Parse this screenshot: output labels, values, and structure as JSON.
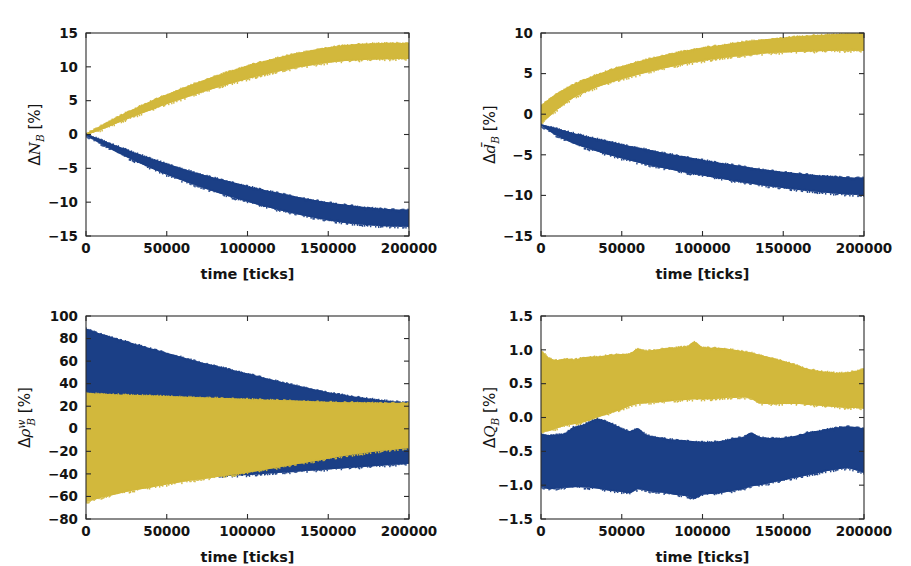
{
  "figure": {
    "width": 911,
    "height": 566,
    "background": "#ffffff",
    "colors": {
      "yellow": "#d2b83c",
      "blue": "#1b3f86",
      "axis": "#2a2a2a",
      "text": "#141414"
    },
    "series_names": [
      "yellow-band",
      "blue-band"
    ]
  },
  "chart_data": [
    {
      "id": "panel-top-left",
      "type": "area",
      "title": "",
      "xlabel": "time [ticks]",
      "ylabel": "ΔN_B [%]",
      "ylabel_parts": {
        "delta": "Δ",
        "symbol": "N",
        "sub": "B",
        "unit": " [%]",
        "overbar": false,
        "sup": ""
      },
      "xlim": [
        0,
        200000
      ],
      "ylim": [
        -15,
        15
      ],
      "xticks": [
        0,
        50000,
        100000,
        150000,
        200000
      ],
      "xticklabels": [
        "0",
        "50000",
        "100000",
        "150000",
        "200000"
      ],
      "yticks": [
        15,
        10,
        5,
        0,
        -5,
        -10,
        -15
      ],
      "yticklabels": [
        "15",
        "10",
        "5",
        "0",
        "−5",
        "−10",
        "−15"
      ],
      "grid": false,
      "legend": "none",
      "x": [
        0,
        10000,
        20000,
        30000,
        40000,
        50000,
        60000,
        70000,
        80000,
        90000,
        100000,
        110000,
        120000,
        130000,
        140000,
        150000,
        160000,
        170000,
        180000,
        190000,
        200000
      ],
      "series": [
        {
          "name": "yellow-band",
          "color": "#d2b83c",
          "upper": [
            0.15,
            1.45,
            2.7,
            3.85,
            4.95,
            5.95,
            6.9,
            7.8,
            8.65,
            9.45,
            10.2,
            10.85,
            11.45,
            12.0,
            12.5,
            12.9,
            13.2,
            13.4,
            13.5,
            13.55,
            13.5
          ],
          "lower": [
            -0.1,
            0.75,
            1.75,
            2.7,
            3.6,
            4.5,
            5.3,
            6.1,
            6.85,
            7.55,
            8.2,
            8.8,
            9.35,
            9.85,
            10.25,
            10.6,
            10.85,
            11.0,
            11.1,
            11.15,
            11.15
          ]
        },
        {
          "name": "blue-band",
          "color": "#1b3f86",
          "upper": [
            0.1,
            -0.8,
            -1.75,
            -2.65,
            -3.5,
            -4.3,
            -5.05,
            -5.75,
            -6.4,
            -7.0,
            -7.6,
            -8.15,
            -8.65,
            -9.15,
            -9.6,
            -10.0,
            -10.35,
            -10.65,
            -10.9,
            -11.05,
            -11.1
          ],
          "lower": [
            -0.15,
            -1.5,
            -2.75,
            -3.9,
            -4.95,
            -5.95,
            -6.85,
            -7.7,
            -8.5,
            -9.25,
            -9.95,
            -10.6,
            -11.2,
            -11.75,
            -12.25,
            -12.7,
            -13.05,
            -13.3,
            -13.5,
            -13.6,
            -13.65
          ]
        }
      ]
    },
    {
      "id": "panel-top-right",
      "type": "area",
      "title": "",
      "xlabel": "time [ticks]",
      "ylabel": "Δd̄_B [%]",
      "ylabel_parts": {
        "delta": "Δ",
        "symbol": "d",
        "sub": "B",
        "unit": " [%]",
        "overbar": true,
        "sup": ""
      },
      "xlim": [
        0,
        200000
      ],
      "ylim": [
        -15,
        10
      ],
      "xticks": [
        0,
        50000,
        100000,
        150000,
        200000
      ],
      "xticklabels": [
        "0",
        "50000",
        "100000",
        "150000",
        "200000"
      ],
      "yticks": [
        10,
        5,
        0,
        -5,
        -10,
        -15
      ],
      "yticklabels": [
        "10",
        "5",
        "0",
        "−5",
        "−10",
        "−15"
      ],
      "grid": false,
      "legend": "none",
      "x": [
        0,
        10000,
        20000,
        30000,
        40000,
        50000,
        60000,
        70000,
        80000,
        90000,
        100000,
        110000,
        120000,
        130000,
        140000,
        150000,
        160000,
        170000,
        180000,
        190000,
        200000
      ],
      "series": [
        {
          "name": "yellow-band",
          "color": "#d2b83c",
          "upper": [
            1.1,
            2.6,
            3.7,
            4.55,
            5.3,
            5.95,
            6.5,
            7.0,
            7.45,
            7.85,
            8.2,
            8.5,
            8.8,
            9.05,
            9.25,
            9.45,
            9.6,
            9.75,
            9.85,
            9.95,
            10.0
          ],
          "lower": [
            -1.2,
            0.55,
            2.0,
            2.95,
            3.7,
            4.3,
            4.85,
            5.35,
            5.8,
            6.2,
            6.55,
            6.85,
            7.1,
            7.3,
            7.5,
            7.6,
            7.7,
            7.75,
            7.8,
            7.8,
            7.8
          ]
        },
        {
          "name": "blue-band",
          "color": "#1b3f86",
          "upper": [
            -1.25,
            -1.75,
            -2.3,
            -2.8,
            -3.25,
            -3.7,
            -4.1,
            -4.5,
            -4.9,
            -5.25,
            -5.6,
            -5.95,
            -6.25,
            -6.55,
            -6.85,
            -7.1,
            -7.3,
            -7.5,
            -7.65,
            -7.75,
            -7.8
          ],
          "lower": [
            -1.4,
            -2.7,
            -3.6,
            -4.3,
            -4.9,
            -5.45,
            -5.95,
            -6.4,
            -6.8,
            -7.2,
            -7.55,
            -7.9,
            -8.25,
            -8.55,
            -8.85,
            -9.1,
            -9.35,
            -9.55,
            -9.75,
            -9.9,
            -10.0
          ]
        }
      ]
    },
    {
      "id": "panel-bottom-left",
      "type": "area",
      "title": "",
      "xlabel": "time [ticks]",
      "ylabel": "Δρ_B^w [%]",
      "ylabel_parts": {
        "delta": "Δ",
        "symbol": "ρ",
        "sub": "B",
        "unit": " [%]",
        "overbar": false,
        "sup": "w"
      },
      "xlim": [
        0,
        200000
      ],
      "ylim": [
        -80,
        100
      ],
      "xticks": [
        0,
        50000,
        100000,
        150000,
        200000
      ],
      "xticklabels": [
        "0",
        "50000",
        "100000",
        "150000",
        "200000"
      ],
      "yticks": [
        100,
        80,
        60,
        40,
        20,
        0,
        -20,
        -40,
        -60,
        -80
      ],
      "yticklabels": [
        "100",
        "80",
        "60",
        "40",
        "20",
        "0",
        "−20",
        "−40",
        "−60",
        "−80"
      ],
      "grid": false,
      "legend": "none",
      "x": [
        0,
        10000,
        20000,
        30000,
        40000,
        50000,
        60000,
        70000,
        80000,
        90000,
        100000,
        110000,
        120000,
        130000,
        140000,
        150000,
        160000,
        170000,
        180000,
        190000,
        200000
      ],
      "series": [
        {
          "name": "blue-band",
          "color": "#1b3f86",
          "upper": [
            89,
            84,
            79.5,
            75.5,
            71.5,
            67.5,
            63.5,
            59.5,
            56,
            52.5,
            49,
            45.5,
            42,
            38.5,
            35.5,
            32.5,
            30,
            28,
            26,
            24.5,
            23.5
          ],
          "lower": [
            -44,
            -44.5,
            -44.5,
            -44.5,
            -44,
            -43.5,
            -43,
            -42.5,
            -42,
            -41.5,
            -41,
            -40,
            -39,
            -38,
            -37,
            -36,
            -35,
            -34,
            -33,
            -32,
            -31
          ]
        },
        {
          "name": "yellow-band",
          "color": "#d2b83c",
          "upper": [
            32,
            31,
            30.5,
            30,
            29.5,
            29,
            28.5,
            28,
            27.5,
            27,
            26.5,
            26,
            25.5,
            25,
            24.5,
            24,
            23.5,
            23.5,
            23,
            23,
            23
          ],
          "lower": [
            -65,
            -61,
            -57.5,
            -54.5,
            -52,
            -49.5,
            -47,
            -45,
            -43,
            -41,
            -39,
            -36.5,
            -34,
            -31.5,
            -29,
            -26.5,
            -24,
            -22,
            -20,
            -18.5,
            -17
          ]
        }
      ]
    },
    {
      "id": "panel-bottom-right",
      "type": "area",
      "title": "",
      "xlabel": "time [ticks]",
      "ylabel": "ΔQ_B [%]",
      "ylabel_parts": {
        "delta": "Δ",
        "symbol": "Q",
        "sub": "B",
        "unit": " [%]",
        "overbar": false,
        "sup": ""
      },
      "xlim": [
        0,
        200000
      ],
      "ylim": [
        -1.5,
        1.5
      ],
      "xticks": [
        0,
        50000,
        100000,
        150000,
        200000
      ],
      "xticklabels": [
        "0",
        "50000",
        "100000",
        "150000",
        "200000"
      ],
      "yticks": [
        1.5,
        1.0,
        0.5,
        0.0,
        -0.5,
        -1.0,
        -1.5
      ],
      "yticklabels": [
        "1.5",
        "1.0",
        "0.5",
        "0.0",
        "−0.5",
        "−1.0",
        "−1.5"
      ],
      "grid": false,
      "legend": "none",
      "x": [
        0,
        5000,
        10000,
        15000,
        20000,
        25000,
        30000,
        35000,
        40000,
        45000,
        50000,
        55000,
        60000,
        65000,
        70000,
        75000,
        80000,
        85000,
        90000,
        95000,
        100000,
        105000,
        110000,
        115000,
        120000,
        125000,
        130000,
        135000,
        140000,
        145000,
        150000,
        155000,
        160000,
        165000,
        170000,
        175000,
        180000,
        185000,
        190000,
        195000,
        200000
      ],
      "series": [
        {
          "name": "yellow-band",
          "color": "#d2b83c",
          "upper": [
            1.0,
            0.88,
            0.85,
            0.87,
            0.86,
            0.88,
            0.9,
            0.9,
            0.92,
            0.93,
            0.94,
            0.95,
            1.02,
            0.99,
            1.0,
            1.02,
            1.03,
            1.04,
            1.05,
            1.12,
            1.04,
            1.03,
            1.03,
            1.02,
            1.0,
            0.98,
            0.96,
            0.93,
            0.9,
            0.87,
            0.84,
            0.8,
            0.76,
            0.72,
            0.7,
            0.68,
            0.67,
            0.66,
            0.67,
            0.69,
            0.72
          ],
          "lower": [
            -0.22,
            -0.2,
            -0.16,
            -0.12,
            -0.1,
            -0.08,
            -0.04,
            0.0,
            0.04,
            0.08,
            0.12,
            0.17,
            0.2,
            0.21,
            0.22,
            0.23,
            0.24,
            0.25,
            0.26,
            0.27,
            0.27,
            0.27,
            0.28,
            0.29,
            0.29,
            0.3,
            0.28,
            0.21,
            0.2,
            0.2,
            0.2,
            0.2,
            0.2,
            0.19,
            0.18,
            0.17,
            0.16,
            0.15,
            0.14,
            0.14,
            0.13
          ]
        },
        {
          "name": "blue-band",
          "color": "#1b3f86",
          "upper": [
            -0.24,
            -0.26,
            -0.25,
            -0.23,
            -0.14,
            -0.12,
            -0.06,
            -0.02,
            -0.05,
            -0.1,
            -0.16,
            -0.2,
            -0.16,
            -0.25,
            -0.28,
            -0.3,
            -0.32,
            -0.33,
            -0.34,
            -0.35,
            -0.36,
            -0.36,
            -0.35,
            -0.33,
            -0.3,
            -0.29,
            -0.22,
            -0.28,
            -0.3,
            -0.3,
            -0.3,
            -0.28,
            -0.26,
            -0.22,
            -0.2,
            -0.18,
            -0.16,
            -0.14,
            -0.13,
            -0.14,
            -0.16
          ],
          "lower": [
            -1.02,
            -1.06,
            -1.05,
            -1.04,
            -1.03,
            -1.03,
            -1.04,
            -1.05,
            -1.07,
            -1.09,
            -1.1,
            -1.12,
            -1.06,
            -1.08,
            -1.1,
            -1.11,
            -1.13,
            -1.15,
            -1.16,
            -1.2,
            -1.14,
            -1.13,
            -1.12,
            -1.1,
            -1.08,
            -1.06,
            -1.02,
            -1.0,
            -0.98,
            -0.95,
            -0.93,
            -0.9,
            -0.88,
            -0.85,
            -0.83,
            -0.8,
            -0.78,
            -0.76,
            -0.75,
            -0.78,
            -0.82
          ]
        }
      ]
    }
  ]
}
